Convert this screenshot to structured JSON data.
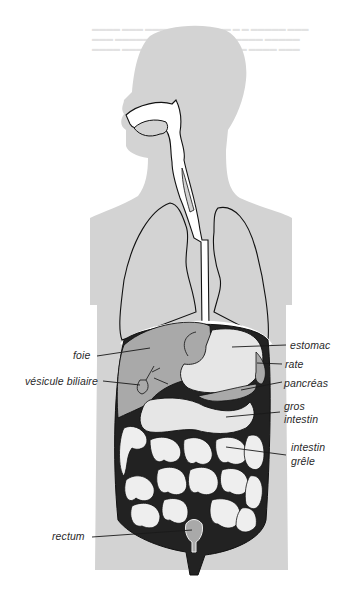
{
  "diagram": {
    "title": "",
    "colors": {
      "silhouette": "#d3d3d3",
      "organ_dark": "#a9a9a9",
      "organ_light": "#e6e6e6",
      "outline": "#1a1a1a",
      "cavity": "#222222",
      "background": "#ffffff"
    },
    "labels": [
      {
        "id": "foie",
        "text": "foie"
      },
      {
        "id": "vesicule",
        "text": "vésicule biliaire"
      },
      {
        "id": "estomac",
        "text": "estomac"
      },
      {
        "id": "rate",
        "text": "rate"
      },
      {
        "id": "pancreas",
        "text": "pancréas"
      },
      {
        "id": "gros_intestin_1",
        "text": "gros"
      },
      {
        "id": "gros_intestin_2",
        "text": "intestin"
      },
      {
        "id": "intestin_grele_1",
        "text": "intestin"
      },
      {
        "id": "intestin_grele_2",
        "text": "grêle"
      },
      {
        "id": "rectum",
        "text": "rectum"
      }
    ]
  }
}
